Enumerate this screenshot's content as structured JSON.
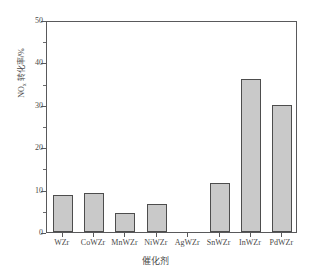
{
  "top_strip_text": "",
  "chart_data": {
    "type": "bar",
    "title": "",
    "xlabel": "催化剂",
    "ylabel": "NOx 转化率/%",
    "ylabel_main": "NO",
    "ylabel_sub": "x",
    "ylabel_tail": " 转化率/%",
    "categories": [
      "WZr",
      "CoWZr",
      "MnWZr",
      "NiWZr",
      "AgWZr",
      "SnWZr",
      "InWZr",
      "PdWZr"
    ],
    "values": [
      8.8,
      9.3,
      4.5,
      6.6,
      0,
      11.5,
      36,
      30
    ],
    "ylim": [
      0,
      50
    ],
    "ytick_labels": [
      "0",
      "10",
      "20",
      "30",
      "40",
      "50"
    ],
    "ytick_values": [
      0,
      10,
      20,
      30,
      40,
      50
    ],
    "yminor_values": [
      5,
      15,
      25,
      35,
      45
    ],
    "grid": false,
    "legend": null,
    "bar_fill_color": "#c9c9c9",
    "bar_edge_color": "#4d4d4d",
    "axis_color": "#59595b"
  }
}
